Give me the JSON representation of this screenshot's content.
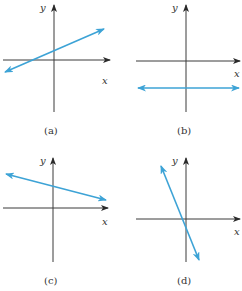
{
  "colors": {
    "line": "#3da3d6",
    "axis": "#3a3a3a",
    "background": "#ffffff"
  },
  "axis_labels": {
    "x": "x",
    "y": "y"
  },
  "panels": [
    {
      "caption": "(a)",
      "description": "line with positive slope, positive y-intercept"
    },
    {
      "caption": "(b)",
      "description": "horizontal line below x-axis (zero slope, negative intercept)"
    },
    {
      "caption": "(c)",
      "description": "line with small negative slope, positive y-intercept"
    },
    {
      "caption": "(d)",
      "description": "line with steep negative slope, negative y-intercept"
    }
  ]
}
